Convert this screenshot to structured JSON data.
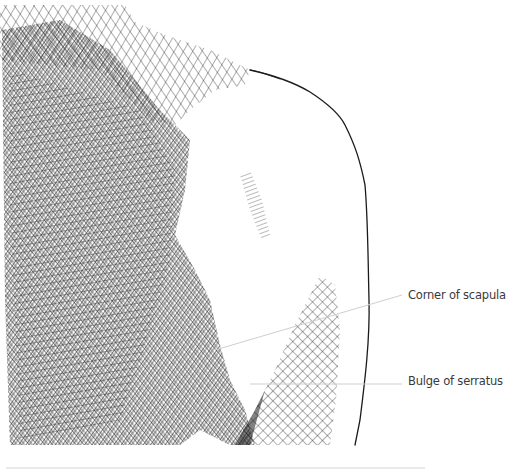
{
  "figure": {
    "labels": [
      {
        "id": "scapula",
        "text": "Corner of scapula"
      },
      {
        "id": "serratus",
        "text": "Bulge of serratus"
      }
    ],
    "colors": {
      "background": "#ffffff",
      "ink": "#1a1a1a",
      "leader_line": "#cfcfcf",
      "label_text": "#3a3a3a"
    }
  }
}
